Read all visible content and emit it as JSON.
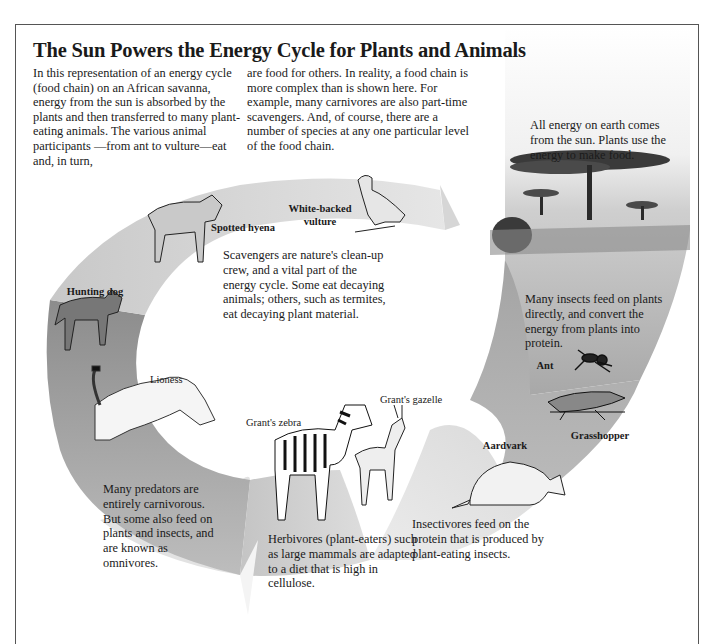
{
  "title": "The Sun Powers the Energy Cycle for Plants and Animals",
  "intro": {
    "column_1": "In this representation of an energy cycle (food chain) on an African savanna, energy from the sun is absorbed by the plants and then transferred to many plant-eating animals. The various animal participants —from ant to vulture—eat and, in turn,",
    "column_2": "are food for others. In reality, a food chain is more complex than is shown here. For example, many carnivores are also part-time scavengers. And, of course, there are a number of species at any one particular level of the food chain."
  },
  "stages": {
    "sun_plants": {
      "caption": "All energy on earth comes from the sun. Plants use the energy to make food."
    },
    "insects": {
      "caption": "Many insects feed on plants directly, and convert the energy from plants into protein.",
      "labels": [
        "Ant",
        "Grasshopper"
      ]
    },
    "insectivores": {
      "caption": "Insectivores feed on the protein that is produced by plant-eating insects.",
      "labels": [
        "Aardvark"
      ]
    },
    "herbivores": {
      "caption": "Herbivores (plant-eaters) such as large mammals are adapted to a diet that is high in cellulose.",
      "labels": [
        "Grant's zebra",
        "Grant's gazelle"
      ]
    },
    "predators": {
      "caption": "Many predators are entirely carnivorous. But some also feed on plants and insects, and are known as omnivores.",
      "labels": [
        "Hunting dog",
        "Lioness"
      ]
    },
    "scavengers": {
      "caption": "Scavengers are nature's clean-up crew, and a vital part of the energy cycle. Some eat decaying animals; others, such as termites, eat decaying plant material.",
      "labels": [
        "Spotted hyena",
        "White-backed vulture"
      ]
    }
  },
  "colors": {
    "band_dark": "#8f8f8f",
    "band_mid": "#b5b5b5",
    "band_light": "#dcdcdc",
    "frame": "#555555",
    "text": "#1a1a1a"
  }
}
